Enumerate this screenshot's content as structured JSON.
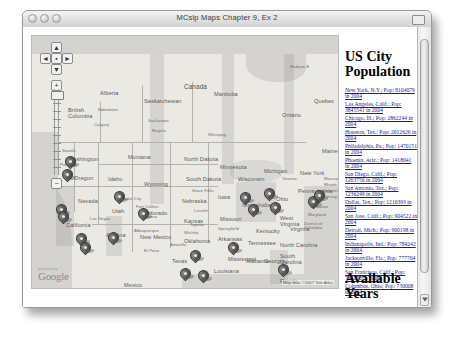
{
  "window": {
    "title": "MCslp Maps Chapter 9, Ex 2",
    "traffic_lights": [
      "close",
      "minimize",
      "zoom"
    ],
    "resize_label": ""
  },
  "map": {
    "controls": {
      "pan_up": "▲",
      "pan_left": "◄",
      "pan_right": "►",
      "pan_down": "▼",
      "center": "▪",
      "zoom_in": "+",
      "zoom_out": "−"
    },
    "logo": {
      "tagline": "powered by",
      "text": "Google"
    },
    "attribution": "Map data ©2007 Tele Atlas",
    "terms": "Terms of Use",
    "labels": [
      {
        "text": "Canada",
        "x": 152,
        "y": 47,
        "cls": "country"
      },
      {
        "text": "Hudson B",
        "x": 258,
        "y": 28,
        "cls": ""
      },
      {
        "text": "Alberta",
        "x": 68,
        "y": 54,
        "cls": "big"
      },
      {
        "text": "Saskatchewan",
        "x": 112,
        "y": 62,
        "cls": "big"
      },
      {
        "text": "Manitoba",
        "x": 182,
        "y": 55,
        "cls": "big"
      },
      {
        "text": "Ontario",
        "x": 250,
        "y": 76,
        "cls": "big"
      },
      {
        "text": "Quebec",
        "x": 282,
        "y": 62,
        "cls": "big"
      },
      {
        "text": "British\nColumbia",
        "x": 36,
        "y": 72,
        "cls": "big"
      },
      {
        "text": "Edmonton",
        "x": 66,
        "y": 71,
        "cls": ""
      },
      {
        "text": "Calgary",
        "x": 62,
        "y": 86,
        "cls": ""
      },
      {
        "text": "Saskatoon",
        "x": 116,
        "y": 82,
        "cls": ""
      },
      {
        "text": "Regina",
        "x": 120,
        "y": 92,
        "cls": ""
      },
      {
        "text": "Winnipeg",
        "x": 176,
        "y": 96,
        "cls": ""
      },
      {
        "text": "Washington",
        "x": 36,
        "y": 120,
        "cls": "big"
      },
      {
        "text": "Montana",
        "x": 96,
        "y": 118,
        "cls": "big"
      },
      {
        "text": "North Dakota",
        "x": 152,
        "y": 120,
        "cls": "big"
      },
      {
        "text": "Minnesota",
        "x": 188,
        "y": 128,
        "cls": "big"
      },
      {
        "text": "Oregon",
        "x": 42,
        "y": 139,
        "cls": "big"
      },
      {
        "text": "Idaho",
        "x": 76,
        "y": 140,
        "cls": "big"
      },
      {
        "text": "Wyoming",
        "x": 112,
        "y": 145,
        "cls": "big"
      },
      {
        "text": "South Dakota",
        "x": 154,
        "y": 140,
        "cls": "big"
      },
      {
        "text": "Wisconsin",
        "x": 206,
        "y": 140,
        "cls": "big"
      },
      {
        "text": "Michigan",
        "x": 232,
        "y": 132,
        "cls": "big"
      },
      {
        "text": "Maine",
        "x": 290,
        "y": 112,
        "cls": "big"
      },
      {
        "text": "Seattle",
        "x": 30,
        "y": 112,
        "cls": ""
      },
      {
        "text": "Portland",
        "x": 28,
        "y": 126,
        "cls": ""
      },
      {
        "text": "Salt Lake City",
        "x": 82,
        "y": 160,
        "cls": ""
      },
      {
        "text": "Nebraska",
        "x": 150,
        "y": 162,
        "cls": "big"
      },
      {
        "text": "Iowa",
        "x": 186,
        "y": 158,
        "cls": "big"
      },
      {
        "text": "Nevada",
        "x": 46,
        "y": 162,
        "cls": "big"
      },
      {
        "text": "Utah",
        "x": 80,
        "y": 172,
        "cls": "big"
      },
      {
        "text": "Colorado",
        "x": 112,
        "y": 174,
        "cls": "big"
      },
      {
        "text": "Kansas",
        "x": 152,
        "y": 182,
        "cls": "big"
      },
      {
        "text": "Missouri",
        "x": 188,
        "y": 180,
        "cls": "big"
      },
      {
        "text": "Illinois",
        "x": 210,
        "y": 166,
        "cls": "big"
      },
      {
        "text": "Indiana",
        "x": 226,
        "y": 166,
        "cls": "big"
      },
      {
        "text": "Ohio",
        "x": 244,
        "y": 160,
        "cls": "big"
      },
      {
        "text": "Pennsylvania",
        "x": 266,
        "y": 152,
        "cls": "big"
      },
      {
        "text": "New York",
        "x": 268,
        "y": 134,
        "cls": "big"
      },
      {
        "text": "Toronto",
        "x": 250,
        "y": 140,
        "cls": ""
      },
      {
        "text": "Fort Collins",
        "x": 104,
        "y": 168,
        "cls": ""
      },
      {
        "text": "Aurora",
        "x": 112,
        "y": 178,
        "cls": ""
      },
      {
        "text": "Denver",
        "x": 106,
        "y": 174,
        "cls": ""
      },
      {
        "text": "Sioux Falls",
        "x": 160,
        "y": 152,
        "cls": ""
      },
      {
        "text": "Lincoln",
        "x": 162,
        "y": 172,
        "cls": ""
      },
      {
        "text": "Topeka",
        "x": 158,
        "y": 186,
        "cls": ""
      },
      {
        "text": "Wichita",
        "x": 152,
        "y": 194,
        "cls": ""
      },
      {
        "text": "Springfield",
        "x": 186,
        "y": 190,
        "cls": ""
      },
      {
        "text": "California",
        "x": 34,
        "y": 186,
        "cls": "big"
      },
      {
        "text": "Arizona",
        "x": 74,
        "y": 196,
        "cls": "big"
      },
      {
        "text": "New Mexico",
        "x": 108,
        "y": 198,
        "cls": "big"
      },
      {
        "text": "Oklahoma",
        "x": 152,
        "y": 202,
        "cls": "big"
      },
      {
        "text": "Arkansas",
        "x": 186,
        "y": 200,
        "cls": "big"
      },
      {
        "text": "Kentucky",
        "x": 224,
        "y": 192,
        "cls": "big"
      },
      {
        "text": "Tennessee",
        "x": 216,
        "y": 204,
        "cls": "big"
      },
      {
        "text": "West\nVirginia",
        "x": 248,
        "y": 180,
        "cls": "big"
      },
      {
        "text": "Virginia",
        "x": 258,
        "y": 190,
        "cls": "big"
      },
      {
        "text": "North Carolina",
        "x": 248,
        "y": 206,
        "cls": "big"
      },
      {
        "text": "South\nCarolina",
        "x": 248,
        "y": 218,
        "cls": "big"
      },
      {
        "text": "Mississippi",
        "x": 196,
        "y": 220,
        "cls": "big"
      },
      {
        "text": "Alabama",
        "x": 214,
        "y": 222,
        "cls": "big"
      },
      {
        "text": "Georgia",
        "x": 232,
        "y": 222,
        "cls": "big"
      },
      {
        "text": "Texas",
        "x": 140,
        "y": 222,
        "cls": "big"
      },
      {
        "text": "Louisiana",
        "x": 182,
        "y": 232,
        "cls": "big"
      },
      {
        "text": "Florida",
        "x": 248,
        "y": 242,
        "cls": "big"
      },
      {
        "text": "Albuquerque",
        "x": 102,
        "y": 192,
        "cls": ""
      },
      {
        "text": "El Paso",
        "x": 112,
        "y": 212,
        "cls": ""
      },
      {
        "text": "Amarillo",
        "x": 138,
        "y": 206,
        "cls": ""
      },
      {
        "text": "Las Vegas",
        "x": 58,
        "y": 180,
        "cls": ""
      },
      {
        "text": "New Jersey",
        "x": 282,
        "y": 158,
        "cls": ""
      },
      {
        "text": "Delaware",
        "x": 278,
        "y": 168,
        "cls": ""
      },
      {
        "text": "Maryland",
        "x": 276,
        "y": 176,
        "cls": ""
      },
      {
        "text": "District of\nColumbia",
        "x": 272,
        "y": 186,
        "cls": ""
      },
      {
        "text": "Rhode Island",
        "x": 292,
        "y": 146,
        "cls": ""
      },
      {
        "text": "Connecticut",
        "x": 290,
        "y": 152,
        "cls": ""
      },
      {
        "text": "Massachusetts",
        "x": 292,
        "y": 140,
        "cls": ""
      },
      {
        "text": "Gulf of\nMexico",
        "x": 176,
        "y": 252,
        "cls": "big"
      },
      {
        "text": "Mexico",
        "x": 92,
        "y": 246,
        "cls": "big"
      }
    ],
    "markers": [
      {
        "name": "seattle",
        "x": 33,
        "y": 120
      },
      {
        "name": "portland",
        "x": 30,
        "y": 133
      },
      {
        "name": "san-francisco",
        "x": 24,
        "y": 168
      },
      {
        "name": "san-jose",
        "x": 26,
        "y": 175
      },
      {
        "name": "salt-lake-city",
        "x": 82,
        "y": 155
      },
      {
        "name": "los-angeles",
        "x": 44,
        "y": 197
      },
      {
        "name": "san-diego",
        "x": 48,
        "y": 206
      },
      {
        "name": "phoenix",
        "x": 76,
        "y": 196
      },
      {
        "name": "denver",
        "x": 106,
        "y": 172
      },
      {
        "name": "san-antonio",
        "x": 148,
        "y": 232
      },
      {
        "name": "dallas",
        "x": 158,
        "y": 214
      },
      {
        "name": "houston",
        "x": 166,
        "y": 234
      },
      {
        "name": "chicago",
        "x": 208,
        "y": 156
      },
      {
        "name": "indianapolis",
        "x": 216,
        "y": 168
      },
      {
        "name": "detroit",
        "x": 232,
        "y": 152
      },
      {
        "name": "columbus",
        "x": 238,
        "y": 166
      },
      {
        "name": "philadelphia",
        "x": 276,
        "y": 160
      },
      {
        "name": "new-york",
        "x": 282,
        "y": 154
      },
      {
        "name": "jacksonville",
        "x": 246,
        "y": 228
      },
      {
        "name": "memphis",
        "x": 196,
        "y": 206
      }
    ]
  },
  "sidebar": {
    "title": "US City Population",
    "available_years_title": "Available Years",
    "cities": [
      "New York, N.Y.; Pop: 8104079 in 2004",
      "Los Angeles, Calif.; Pop: 3845541 in 2004",
      "Chicago, Ill.; Pop: 2862244 in 2004",
      "Houston, Tex.; Pop: 2012626 in 2004",
      "Philadelphia, Pa.; Pop: 1470151 in 2004",
      "Phoenix, Ariz.; Pop: 1418041 in 2004",
      "San Diego, Calif.; Pop: 1263756 in 2004",
      "San Antonio, Tex.; Pop: 1236249 in 2004",
      "Dallas, Tex.; Pop: 1210393 in 2004",
      "San Jose, Calif.; Pop: 904522 in 2004",
      "Detroit, Mich.; Pop: 900198 in 2004",
      "Indianapolis, Ind.; Pop: 784242 in 2004",
      "Jacksonville, Fla.; Pop: 777704 in 2004",
      "San Francisco, Calif.; Pop: 744230 in 2004",
      "Columbus, Ohio; Pop: 730008 in 2004"
    ]
  }
}
